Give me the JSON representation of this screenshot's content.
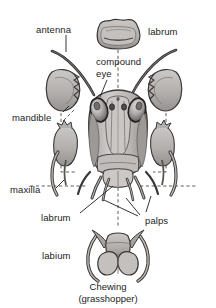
{
  "figure": {
    "background_color": "#ffffff",
    "text_color": "#1b1b1b",
    "line_color": "#2b2b2b",
    "fill_light": "#d6d4d2",
    "fill_mid": "#b3b0ae",
    "fill_dark": "#8d8a88"
  },
  "labels": {
    "antenna": "antenna",
    "labrum_top": "labrum",
    "compound_eye_line1": "compound",
    "compound_eye_line2": "eye",
    "mandible": "mandible",
    "maxilla": "maxilla",
    "labrum_lower": "labrum",
    "palps": "palps",
    "labium": "labium"
  },
  "caption": {
    "line1": "Chewing",
    "line2": "(grasshopper)"
  },
  "parts": [
    {
      "name": "labrum",
      "position": "top-center",
      "label": "labrum"
    },
    {
      "name": "antenna",
      "position": "upper-left-and-right",
      "label": "antenna"
    },
    {
      "name": "compound-eye",
      "position": "head-upper-sides",
      "label": "compound eye"
    },
    {
      "name": "mandible",
      "position": "mid-left-and-right",
      "label": "mandible"
    },
    {
      "name": "maxilla",
      "position": "lower-left-and-right",
      "label": "maxilla"
    },
    {
      "name": "palps",
      "position": "below-head",
      "label": "palps"
    },
    {
      "name": "labium",
      "position": "bottom-center",
      "label": "labium"
    }
  ]
}
